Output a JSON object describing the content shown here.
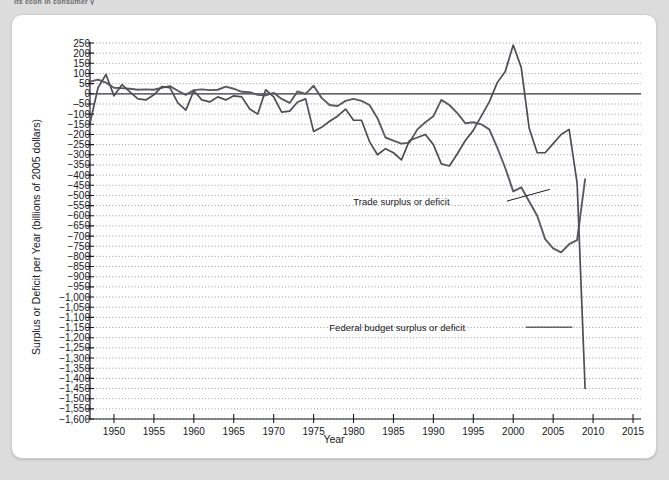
{
  "page": {
    "clipped_header_text": "its econ in consumer y",
    "background_color": "#dcdcdc",
    "card_color": "#ffffff"
  },
  "chart_data": {
    "type": "line",
    "title": "",
    "xlabel": "Year",
    "ylabel": "Surplus or Deficit per Year (billions of 2005 dollars)",
    "xlim": [
      1947,
      2016
    ],
    "ylim": [
      -1600,
      250
    ],
    "grid": true,
    "grid_style": "dotted",
    "legend_position": "inline-annotations",
    "xticks": [
      1950,
      1955,
      1960,
      1965,
      1970,
      1975,
      1980,
      1985,
      1990,
      1995,
      2000,
      2005,
      2010,
      2015
    ],
    "xtick_labels": [
      "1950",
      "1955",
      "1960",
      "1965",
      "1970",
      "1975",
      "1980",
      "1985",
      "1990",
      "1995",
      "2000",
      "2005",
      "2010",
      "2015"
    ],
    "yticks": [
      250,
      200,
      150,
      100,
      50,
      0,
      -50,
      -100,
      -150,
      -200,
      -250,
      -300,
      -350,
      -400,
      -450,
      -500,
      -550,
      -600,
      -650,
      -700,
      -750,
      -800,
      -850,
      -900,
      -950,
      -1000,
      -1050,
      -1100,
      -1150,
      -1200,
      -1250,
      -1300,
      -1350,
      -1400,
      -1450,
      -1500,
      -1550,
      -1600
    ],
    "ytick_labels": [
      "250",
      "200",
      "150",
      "100",
      "50",
      "0",
      "‒50",
      "−100",
      "−150",
      "−200",
      "−250",
      "−300",
      "−350",
      "−400",
      "−450",
      "−500",
      "−550",
      "−600",
      "−650",
      "−700",
      "−750",
      "−800",
      "−850",
      "−900",
      "−950",
      "−1,000",
      "−1,050",
      "−1,100",
      "−1,150",
      "−1,200",
      "−1,250",
      "−1,300",
      "−1,350",
      "−1,400",
      "−1,450",
      "−1,500",
      "−1,550",
      "−1,600"
    ],
    "series": [
      {
        "name": "Trade surplus or deficit",
        "color": "#5a5a62",
        "x": [
          1947,
          1948,
          1949,
          1950,
          1951,
          1952,
          1953,
          1954,
          1955,
          1956,
          1957,
          1958,
          1959,
          1960,
          1961,
          1962,
          1963,
          1964,
          1965,
          1966,
          1967,
          1968,
          1969,
          1970,
          1971,
          1972,
          1973,
          1974,
          1975,
          1976,
          1977,
          1978,
          1979,
          1980,
          1981,
          1982,
          1983,
          1984,
          1985,
          1986,
          1987,
          1988,
          1989,
          1990,
          1991,
          1992,
          1993,
          1994,
          1995,
          1996,
          1997,
          1998,
          1999,
          2000,
          2001,
          2002,
          2003,
          2004,
          2005,
          2006,
          2007,
          2008,
          2009
        ],
        "values": [
          60,
          70,
          55,
          30,
          28,
          25,
          20,
          22,
          20,
          30,
          38,
          15,
          -5,
          18,
          22,
          18,
          20,
          35,
          25,
          10,
          8,
          -5,
          -8,
          5,
          -25,
          -45,
          12,
          0,
          40,
          -20,
          -55,
          -60,
          -35,
          -25,
          -35,
          -55,
          -120,
          -215,
          -230,
          -245,
          -240,
          -175,
          -140,
          -110,
          -30,
          -55,
          -95,
          -145,
          -140,
          -150,
          -175,
          -265,
          -365,
          -480,
          -460,
          -530,
          -600,
          -715,
          -760,
          -780,
          -740,
          -720,
          -420
        ]
      },
      {
        "name": "Federal budget surplus or deficit",
        "color": "#4d4d55",
        "x": [
          1947,
          1948,
          1949,
          1950,
          1951,
          1952,
          1953,
          1954,
          1955,
          1956,
          1957,
          1958,
          1959,
          1960,
          1961,
          1962,
          1963,
          1964,
          1965,
          1966,
          1967,
          1968,
          1969,
          1970,
          1971,
          1972,
          1973,
          1974,
          1975,
          1976,
          1977,
          1978,
          1979,
          1980,
          1981,
          1982,
          1983,
          1984,
          1985,
          1986,
          1987,
          1988,
          1989,
          1990,
          1991,
          1992,
          1993,
          1994,
          1995,
          1996,
          1997,
          1998,
          1999,
          2000,
          2001,
          2002,
          2003,
          2004,
          2005,
          2006,
          2007,
          2008,
          2009
        ],
        "values": [
          -145,
          30,
          95,
          -10,
          45,
          10,
          -25,
          -30,
          -5,
          35,
          30,
          -45,
          -80,
          15,
          -30,
          -40,
          -15,
          -30,
          -10,
          -15,
          -75,
          -100,
          20,
          -15,
          -90,
          -85,
          -40,
          -25,
          -185,
          -165,
          -135,
          -110,
          -75,
          -130,
          -130,
          -235,
          -300,
          -270,
          -290,
          -325,
          -230,
          -215,
          -200,
          -250,
          -345,
          -355,
          -295,
          -230,
          -180,
          -110,
          -40,
          55,
          110,
          240,
          130,
          -170,
          -290,
          -290,
          -245,
          -200,
          -175,
          -440,
          -1450
        ]
      }
    ],
    "annotations": [
      {
        "text": "Trade surplus or deficit",
        "x": 1992,
        "y": -530
      },
      {
        "text": "Federal budget surplus or deficit",
        "x": 1994,
        "y": -1150
      }
    ]
  }
}
